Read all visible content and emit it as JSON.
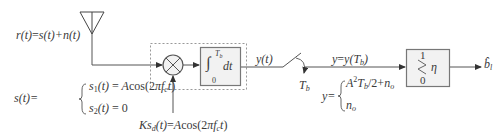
{
  "diagram": {
    "received": {
      "lhs": "r(t)",
      "eq": "=",
      "rhs": "s(t)+n(t)"
    },
    "signal_def": {
      "lhs": "s(t)=",
      "case1": "s1(t) = Acos(2πfct)",
      "case2": "s2(t) = 0"
    },
    "reference": {
      "label": "Ksd(t)=Acos(2πfct)"
    },
    "multiplier": {
      "symbol": "×"
    },
    "integrator": {
      "label": "∫0Tb dt",
      "upper": "Tb",
      "lower": "0",
      "body": "dt"
    },
    "integrator_output": "y(t)",
    "sampler": {
      "label": "Tb"
    },
    "sampled": {
      "label": "y=y(Tb)"
    },
    "sample_values": {
      "lhs": "y=",
      "case1": "A²Tb/2+no",
      "case2": "no"
    },
    "decision": {
      "top": "1",
      "bottom": "0",
      "threshold": "η"
    },
    "output": {
      "label": "b̂l"
    },
    "colors": {
      "line": "#555555",
      "box_fill": "#f2f2f2",
      "box_stroke": "#777777",
      "dashed": "#999999"
    }
  }
}
